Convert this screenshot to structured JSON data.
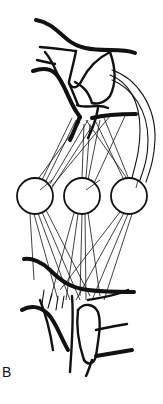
{
  "figure": {
    "panel_label": "B",
    "nodes": [
      {
        "id": "node-left",
        "cx": 35,
        "cy": 196,
        "r": 18
      },
      {
        "id": "node-middle",
        "cx": 82,
        "cy": 196,
        "r": 18
      },
      {
        "id": "node-right",
        "cx": 129,
        "cy": 196,
        "r": 18
      }
    ],
    "colors": {
      "stroke": "#111111",
      "background": "#ffffff"
    }
  }
}
